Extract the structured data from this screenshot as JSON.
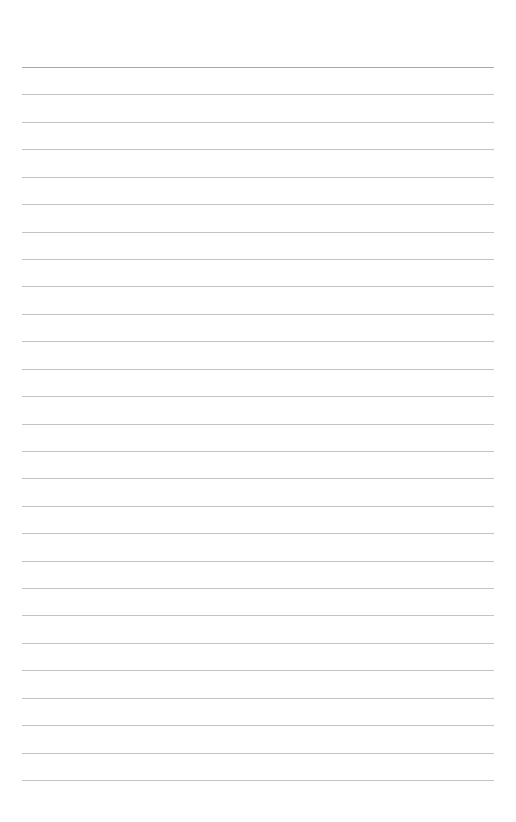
{
  "page": {
    "type": "blank ruled paper",
    "line_count": 27,
    "line_color": "#c4c4c4",
    "background_color": "#ffffff"
  }
}
